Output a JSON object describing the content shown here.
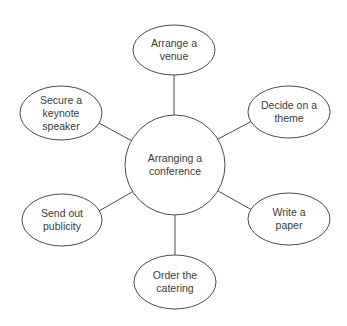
{
  "diagram": {
    "type": "mind-map",
    "colors": {
      "stroke": "#4a4a4a",
      "text": "#3a3a3a",
      "background": "#ffffff"
    },
    "center": {
      "id": "center",
      "lines": [
        "Arranging a",
        "conference"
      ],
      "cx": 175,
      "cy": 165,
      "r": 50
    },
    "nodes": [
      {
        "id": "venue",
        "lines": [
          "Arrange a",
          "venue"
        ],
        "cx": 174,
        "cy": 50,
        "rx": 41,
        "ry": 25,
        "edge": {
          "x1": 174,
          "y1": 75,
          "x2": 174,
          "y2": 115
        }
      },
      {
        "id": "theme",
        "lines": [
          "Decide on a",
          "theme"
        ],
        "cx": 289,
        "cy": 112,
        "rx": 41,
        "ry": 26,
        "edge": {
          "x1": 252,
          "y1": 121,
          "x2": 218,
          "y2": 139
        }
      },
      {
        "id": "paper",
        "lines": [
          "Write a",
          "paper"
        ],
        "cx": 289,
        "cy": 219,
        "rx": 41,
        "ry": 26,
        "edge": {
          "x1": 252,
          "y1": 210,
          "x2": 218,
          "y2": 191
        }
      },
      {
        "id": "catering",
        "lines": [
          "Order the",
          "catering"
        ],
        "cx": 175,
        "cy": 282,
        "rx": 41,
        "ry": 27,
        "edge": {
          "x1": 175,
          "y1": 215,
          "x2": 175,
          "y2": 255
        }
      },
      {
        "id": "publicity",
        "lines": [
          "Send out",
          "publicity"
        ],
        "cx": 62,
        "cy": 220,
        "rx": 40,
        "ry": 26,
        "edge": {
          "x1": 99,
          "y1": 211,
          "x2": 132,
          "y2": 192
        }
      },
      {
        "id": "speaker",
        "lines": [
          "Secure a",
          "keynote",
          "speaker"
        ],
        "cx": 61,
        "cy": 113,
        "rx": 41,
        "ry": 27,
        "edge": {
          "x1": 99,
          "y1": 123,
          "x2": 132,
          "y2": 141
        }
      }
    ]
  }
}
